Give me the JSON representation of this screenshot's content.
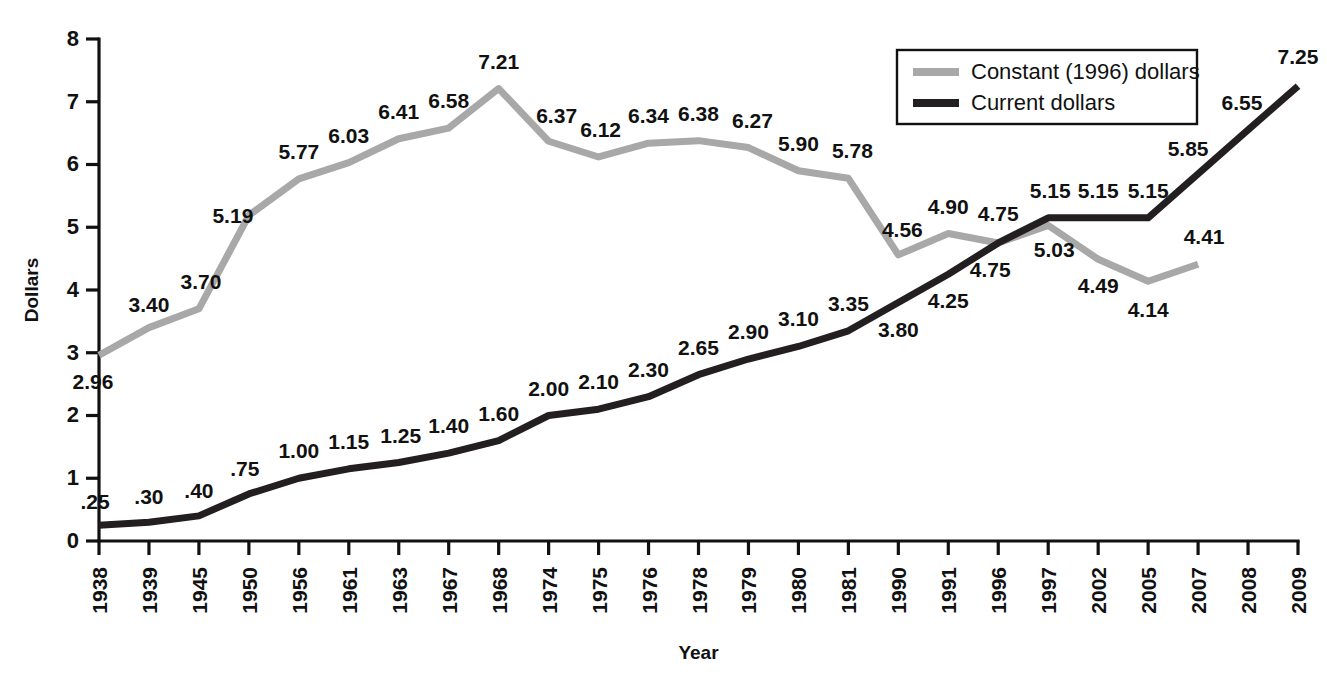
{
  "chart_data": {
    "type": "line",
    "title": "",
    "xlabel": "Year",
    "ylabel": "Dollars",
    "ylim": [
      0,
      8
    ],
    "yticks": [
      "0",
      "1",
      "2",
      "3",
      "4",
      "5",
      "6",
      "7",
      "8"
    ],
    "grid": false,
    "legend_position": "top-right",
    "categories": [
      "1938",
      "1939",
      "1945",
      "1950",
      "1956",
      "1961",
      "1963",
      "1967",
      "1968",
      "1974",
      "1975",
      "1976",
      "1978",
      "1979",
      "1980",
      "1981",
      "1990",
      "1991",
      "1996",
      "1997",
      "2002",
      "2005",
      "2007",
      "2008",
      "2009"
    ],
    "series": [
      {
        "name": "Constant (1996) dollars",
        "color": "#a8a8a8",
        "values": [
          2.96,
          3.4,
          3.7,
          5.19,
          5.77,
          6.03,
          6.41,
          6.58,
          7.21,
          6.37,
          6.12,
          6.34,
          6.38,
          6.27,
          5.9,
          5.78,
          4.56,
          4.9,
          4.75,
          5.03,
          4.49,
          4.14,
          4.41,
          null,
          null
        ],
        "labels": [
          "2.96",
          "3.40",
          "3.70",
          "5.19",
          "5.77",
          "6.03",
          "6.41",
          "6.58",
          "7.21",
          "6.37",
          "6.12",
          "6.34",
          "6.38",
          "6.27",
          "5.90",
          "5.78",
          "4.56",
          "4.90",
          "4.75",
          "5.03",
          "4.49",
          "4.14",
          "4.41",
          null,
          null
        ]
      },
      {
        "name": "Current dollars",
        "color": "#231f20",
        "values": [
          0.25,
          0.3,
          0.4,
          0.75,
          1.0,
          1.15,
          1.25,
          1.4,
          1.6,
          2.0,
          2.1,
          2.3,
          2.65,
          2.9,
          3.1,
          3.35,
          3.8,
          4.25,
          4.75,
          5.15,
          5.15,
          5.15,
          5.85,
          6.55,
          7.25
        ],
        "labels": [
          ".25",
          ".30",
          ".40",
          ".75",
          "1.00",
          "1.15",
          "1.25",
          "1.40",
          "1.60",
          "2.00",
          "2.10",
          "2.30",
          "2.65",
          "2.90",
          "3.10",
          "3.35",
          "3.80",
          "4.25",
          "4.75",
          "5.15",
          "5.15",
          "5.15",
          "5.85",
          "6.55",
          "7.25"
        ]
      }
    ]
  },
  "legend": {
    "items": [
      {
        "label": "Constant (1996) dollars",
        "color": "#a8a8a8"
      },
      {
        "label": "Current dollars",
        "color": "#231f20"
      }
    ]
  },
  "label_offsets": {
    "constant": [
      {
        "dx": -6,
        "dy": 34
      },
      {
        "dx": 0,
        "dy": -16
      },
      {
        "dx": 2,
        "dy": -20
      },
      {
        "dx": -16,
        "dy": 8
      },
      {
        "dx": 0,
        "dy": -20
      },
      {
        "dx": 0,
        "dy": -20
      },
      {
        "dx": 0,
        "dy": -20
      },
      {
        "dx": 0,
        "dy": -20
      },
      {
        "dx": 0,
        "dy": -20
      },
      {
        "dx": 8,
        "dy": -18
      },
      {
        "dx": 2,
        "dy": -20
      },
      {
        "dx": 0,
        "dy": -20
      },
      {
        "dx": 0,
        "dy": -20
      },
      {
        "dx": 4,
        "dy": -20
      },
      {
        "dx": 0,
        "dy": -20
      },
      {
        "dx": 4,
        "dy": -20
      },
      {
        "dx": 4,
        "dy": -18
      },
      {
        "dx": 0,
        "dy": -20
      },
      {
        "dx": 0,
        "dy": -22
      },
      {
        "dx": 6,
        "dy": 32
      },
      {
        "dx": 0,
        "dy": 34
      },
      {
        "dx": 0,
        "dy": 36
      },
      {
        "dx": 6,
        "dy": -20
      }
    ],
    "current": [
      {
        "dx": -4,
        "dy": -16
      },
      {
        "dx": 0,
        "dy": -18
      },
      {
        "dx": 0,
        "dy": -18
      },
      {
        "dx": -4,
        "dy": -18
      },
      {
        "dx": 0,
        "dy": -20
      },
      {
        "dx": 0,
        "dy": -20
      },
      {
        "dx": 2,
        "dy": -20
      },
      {
        "dx": 0,
        "dy": -20
      },
      {
        "dx": 0,
        "dy": -20
      },
      {
        "dx": 0,
        "dy": -20
      },
      {
        "dx": 0,
        "dy": -20
      },
      {
        "dx": 0,
        "dy": -20
      },
      {
        "dx": 0,
        "dy": -20
      },
      {
        "dx": 0,
        "dy": -20
      },
      {
        "dx": 0,
        "dy": -20
      },
      {
        "dx": 0,
        "dy": -20
      },
      {
        "dx": 0,
        "dy": 34
      },
      {
        "dx": 0,
        "dy": 34
      },
      {
        "dx": -8,
        "dy": 34
      },
      {
        "dx": 2,
        "dy": -20
      },
      {
        "dx": 0,
        "dy": -20
      },
      {
        "dx": 0,
        "dy": -20
      },
      {
        "dx": -10,
        "dy": -18
      },
      {
        "dx": -6,
        "dy": -20
      },
      {
        "dx": 0,
        "dy": -22
      }
    ]
  }
}
